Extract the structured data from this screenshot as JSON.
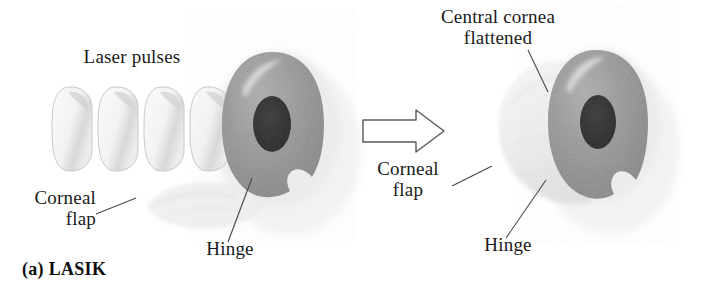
{
  "figure": {
    "title": "LASIK",
    "caption": "(a) LASIK",
    "background_color": "#ffffff",
    "text_color": "#1a1a1a",
    "iris_color": "#8e8e8e",
    "pupil_color": "#1b1b1b",
    "flap_color": "#efefef",
    "pulse_color": "#f4f4f4",
    "outline_color": "#555555"
  },
  "panels": [
    {
      "id": "before",
      "name": "lasik-before-panel",
      "labels": [
        {
          "name": "laser-pulses-label",
          "text": "Laser pulses"
        },
        {
          "name": "corneal-flap-label",
          "text": "Corneal\nflap"
        },
        {
          "name": "hinge-label",
          "text": "Hinge"
        }
      ],
      "laser_pulse_count": 4
    },
    {
      "id": "after",
      "name": "lasik-after-panel",
      "labels": [
        {
          "name": "central-cornea-flattened-label",
          "text": "Central cornea\nflattened"
        },
        {
          "name": "corneal-flap-label",
          "text": "Corneal\nflap"
        },
        {
          "name": "hinge-label",
          "text": "Hinge"
        }
      ]
    }
  ],
  "arrow": {
    "name": "process-arrow",
    "direction": "right",
    "style": "outlined"
  }
}
